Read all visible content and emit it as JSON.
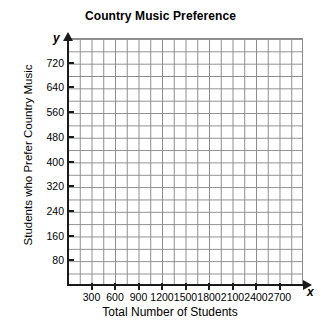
{
  "chart_data": {
    "type": "scatter",
    "title": "Country Music Preference",
    "xlabel": "Total Number of Students",
    "ylabel": "Students who Prefer Country Music",
    "x_axis_variable": "x",
    "y_axis_variable": "y",
    "xlim": [
      0,
      3000
    ],
    "ylim": [
      0,
      800
    ],
    "x_tick_labels": [
      "300",
      "600",
      "900",
      "1200",
      "1500",
      "1800",
      "2100",
      "2400",
      "2700"
    ],
    "x_tick_values": [
      300,
      600,
      900,
      1200,
      1500,
      1800,
      2100,
      2400,
      2700
    ],
    "y_tick_labels": [
      "80",
      "160",
      "240",
      "320",
      "400",
      "480",
      "560",
      "640",
      "720"
    ],
    "y_tick_values": [
      80,
      160,
      240,
      320,
      400,
      480,
      560,
      640,
      720
    ],
    "x_minor_step": 150,
    "y_minor_step": 40,
    "grid": true,
    "grid_color": "#8c8c8c",
    "grid_columns": 20,
    "grid_rows": 20,
    "axis_color": "#1a1a1a",
    "background_color": "#ffffff",
    "legend": null,
    "legend_position": "none",
    "series": [],
    "values": [],
    "annotations": [],
    "note": "Empty coordinate grid with labeled axes; no data points plotted."
  }
}
